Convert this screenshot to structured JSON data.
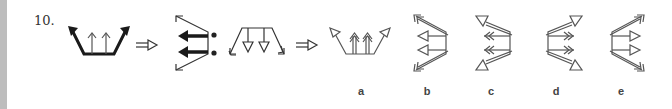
{
  "question": {
    "number": "10.",
    "sequence": [
      {
        "id": "figure-1",
        "description": "trapezoid with two bold outer diagonal arrows up and two thin inner up arrows"
      },
      {
        "id": "implies-1",
        "symbol": "⇒"
      },
      {
        "id": "figure-2",
        "description": "vertical bar with two bold left arrows and two thin outer diagonal arrows"
      },
      {
        "id": "ratio-colon",
        "symbol": ":"
      },
      {
        "id": "figure-3",
        "description": "horizontal bar with two hollow down arrows and two thin outer diagonal arrows"
      },
      {
        "id": "implies-2",
        "symbol": "⇒"
      }
    ],
    "options": [
      {
        "label": "a",
        "description": "trapezoid, double-line inner up arrows with double heads, hollow triangle heads on outer diagonals"
      },
      {
        "label": "b",
        "description": "right vertical bar, hollow triangle left arrows, double-line outer diagonals with double heads"
      },
      {
        "label": "c",
        "description": "right vertical bar, double-chevron left arrows, double-line outer diagonals with hollow triangle heads"
      },
      {
        "label": "d",
        "description": "left vertical bar, double-chevron right arrows, double-line outer diagonals with hollow triangle heads"
      },
      {
        "label": "e",
        "description": "left vertical bar, hollow triangle right arrows, double-line outer diagonals with double heads"
      }
    ]
  },
  "colors": {
    "background": "#ffffff",
    "edge_strip": "#bdbdbd",
    "stroke_dark": "#1a1a1a",
    "stroke_gray": "#555555",
    "text": "#333333"
  }
}
